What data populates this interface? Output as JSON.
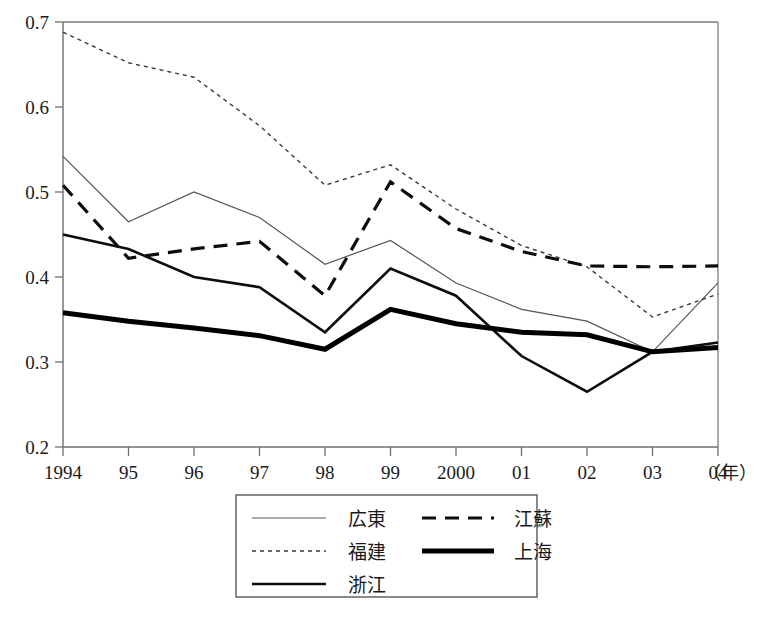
{
  "chart_data": {
    "type": "line",
    "title": "",
    "subtitle": "",
    "xlabel": "年",
    "ylabel": "",
    "x": [
      1994,
      1995,
      1996,
      1997,
      1998,
      1999,
      2000,
      2001,
      2002,
      2003,
      2004
    ],
    "categories": [
      "1994",
      "95",
      "96",
      "97",
      "98",
      "99",
      "2000",
      "01",
      "02",
      "03",
      "04"
    ],
    "xlim": [
      1994,
      2004
    ],
    "ylim": [
      0.2,
      0.7
    ],
    "yticks": [
      "0.2",
      "0.3",
      "0.4",
      "0.5",
      "0.6",
      "0.7"
    ],
    "ytick_values": [
      0.2,
      0.3,
      0.4,
      0.5,
      0.6,
      0.7
    ],
    "grid": false,
    "legend_position": "bottom-center",
    "x_unit_suffix": "（年）",
    "series": [
      {
        "name": "広東",
        "style": "thin-solid",
        "color": "#555555",
        "width": 1.2,
        "values": [
          0.542,
          0.465,
          0.5,
          0.47,
          0.415,
          0.443,
          0.393,
          0.362,
          0.348,
          0.312,
          0.393
        ]
      },
      {
        "name": "福建",
        "style": "dotted",
        "color": "#3a3a3a",
        "width": 1.4,
        "values": [
          0.688,
          0.652,
          0.635,
          0.578,
          0.508,
          0.532,
          0.48,
          0.437,
          0.412,
          0.353,
          0.38
        ]
      },
      {
        "name": "浙江",
        "style": "medium-solid",
        "color": "#0d0d0d",
        "width": 2.6,
        "values": [
          0.45,
          0.433,
          0.4,
          0.388,
          0.335,
          0.41,
          0.378,
          0.307,
          0.265,
          0.312,
          0.323
        ]
      },
      {
        "name": "江蘇",
        "style": "dashed",
        "color": "#0d0d0d",
        "width": 3.2,
        "values": [
          0.508,
          0.422,
          0.433,
          0.442,
          0.378,
          0.512,
          0.457,
          0.43,
          0.413,
          0.412,
          0.413
        ]
      },
      {
        "name": "上海",
        "style": "thick-solid",
        "color": "#000000",
        "width": 5.0,
        "values": [
          0.358,
          0.348,
          0.34,
          0.331,
          0.315,
          0.362,
          0.345,
          0.335,
          0.332,
          0.312,
          0.317
        ]
      }
    ],
    "legend": [
      {
        "label": "広東",
        "style": "thin-solid"
      },
      {
        "label": "江蘇",
        "style": "dashed"
      },
      {
        "label": "福建",
        "style": "dotted"
      },
      {
        "label": "上海",
        "style": "thick-solid"
      },
      {
        "label": "浙江",
        "style": "medium-solid"
      }
    ]
  }
}
